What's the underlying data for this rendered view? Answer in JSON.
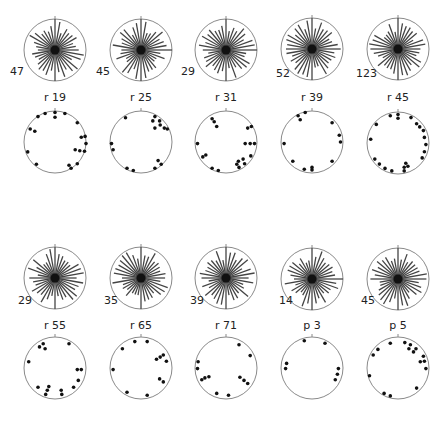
{
  "figure": {
    "colors": {
      "circle_stroke": "#8a8a8a",
      "ray": "#444444",
      "dot": "#111111",
      "text": "#222222"
    },
    "rows": [
      {
        "panels": [
          {
            "id": "r 19",
            "count": "47",
            "cx": 55,
            "rose_cy": 50,
            "dots_cy": 142,
            "r": 31,
            "east_tick": false,
            "dots": [
              [
                -0.55,
                -0.82
              ],
              [
                -0.32,
                -0.92
              ],
              [
                0.0,
                -0.95
              ],
              [
                0.0,
                -0.8
              ],
              [
                0.32,
                -0.92
              ],
              [
                0.72,
                -0.62
              ],
              [
                -0.8,
                -0.42
              ],
              [
                -0.65,
                -0.35
              ],
              [
                0.85,
                -0.15
              ],
              [
                0.97,
                -0.18
              ],
              [
                1.0,
                0.05
              ],
              [
                0.65,
                0.25
              ],
              [
                0.8,
                0.28
              ],
              [
                0.95,
                0.3
              ],
              [
                -0.88,
                0.32
              ],
              [
                -0.6,
                0.72
              ],
              [
                0.45,
                0.75
              ],
              [
                0.52,
                0.85
              ],
              [
                0.72,
                0.7
              ]
            ]
          },
          {
            "id": "r 25",
            "count": "45",
            "cx": 141,
            "rose_cy": 50,
            "dots_cy": 142,
            "r": 31,
            "east_tick": true,
            "dots": [
              [
                -0.5,
                -0.78
              ],
              [
                0.45,
                -0.82
              ],
              [
                0.38,
                -0.68
              ],
              [
                0.6,
                -0.68
              ],
              [
                0.62,
                -0.55
              ],
              [
                0.45,
                -0.45
              ],
              [
                0.75,
                -0.45
              ],
              [
                0.85,
                -0.42
              ],
              [
                -0.95,
                0.05
              ],
              [
                -0.9,
                0.25
              ],
              [
                0.55,
                0.6
              ],
              [
                0.65,
                0.72
              ],
              [
                -0.45,
                0.85
              ],
              [
                -0.25,
                0.92
              ],
              [
                0.45,
                0.85
              ]
            ]
          },
          {
            "id": "r 31",
            "count": "29",
            "cx": 226,
            "rose_cy": 50,
            "dots_cy": 142,
            "r": 31,
            "east_tick": true,
            "dots": [
              [
                -0.45,
                -0.75
              ],
              [
                -0.38,
                -0.65
              ],
              [
                -0.3,
                -0.5
              ],
              [
                0.7,
                -0.45
              ],
              [
                0.82,
                -0.5
              ],
              [
                -0.92,
                0.05
              ],
              [
                0.62,
                0.05
              ],
              [
                0.78,
                0.05
              ],
              [
                0.92,
                0.05
              ],
              [
                -0.75,
                0.48
              ],
              [
                -0.65,
                0.42
              ],
              [
                0.8,
                0.45
              ],
              [
                0.4,
                0.62
              ],
              [
                0.55,
                0.55
              ],
              [
                0.6,
                0.7
              ],
              [
                0.35,
                0.72
              ],
              [
                0.42,
                0.82
              ],
              [
                -0.45,
                0.85
              ],
              [
                -0.25,
                0.92
              ]
            ]
          },
          {
            "id": "r 39",
            "count": "52",
            "cx": 312,
            "rose_cy": 49,
            "dots_cy": 142,
            "r": 31,
            "east_tick": false,
            "dots": [
              [
                -0.45,
                -0.85
              ],
              [
                -0.38,
                -0.72
              ],
              [
                -0.22,
                -0.95
              ],
              [
                0.65,
                -0.62
              ],
              [
                0.88,
                -0.22
              ],
              [
                0.92,
                0.0
              ],
              [
                -0.9,
                0.05
              ],
              [
                -0.62,
                0.62
              ],
              [
                0.65,
                0.62
              ],
              [
                -0.25,
                0.88
              ],
              [
                0.0,
                0.82
              ],
              [
                0.0,
                0.9
              ]
            ]
          },
          {
            "id": "r 45",
            "count": "123",
            "cx": 398,
            "rose_cy": 49,
            "dots_cy": 143,
            "r": 31,
            "east_tick": false,
            "dots": [
              [
                -0.25,
                -0.88
              ],
              [
                0.0,
                -0.92
              ],
              [
                0.0,
                -0.8
              ],
              [
                0.42,
                -0.82
              ],
              [
                -0.7,
                -0.6
              ],
              [
                0.6,
                -0.62
              ],
              [
                0.7,
                -0.52
              ],
              [
                0.82,
                -0.4
              ],
              [
                -0.88,
                -0.12
              ],
              [
                0.85,
                -0.18
              ],
              [
                0.9,
                0.05
              ],
              [
                0.85,
                0.28
              ],
              [
                0.78,
                0.48
              ],
              [
                -0.75,
                0.52
              ],
              [
                -0.6,
                0.68
              ],
              [
                -0.42,
                0.82
              ],
              [
                0.25,
                0.65
              ],
              [
                0.32,
                0.75
              ],
              [
                0.2,
                0.78
              ],
              [
                0.2,
                0.9
              ],
              [
                -0.2,
                0.9
              ]
            ]
          }
        ]
      },
      {
        "panels": [
          {
            "id": "r 55",
            "count": "29",
            "cx": 55,
            "rose_cy": 278,
            "dots_cy": 368,
            "r": 31,
            "east_tick": false,
            "dots": [
              [
                -0.5,
                -0.68
              ],
              [
                -0.38,
                -0.78
              ],
              [
                -0.32,
                -0.62
              ],
              [
                0.45,
                -0.78
              ],
              [
                -0.85,
                -0.2
              ],
              [
                0.72,
                0.05
              ],
              [
                0.85,
                0.05
              ],
              [
                0.75,
                0.4
              ],
              [
                0.6,
                0.62
              ],
              [
                -0.55,
                0.62
              ],
              [
                -0.2,
                0.6
              ],
              [
                -0.25,
                0.72
              ],
              [
                -0.3,
                0.85
              ],
              [
                0.2,
                0.72
              ],
              [
                0.22,
                0.85
              ]
            ]
          },
          {
            "id": "r 65",
            "count": "35",
            "cx": 141,
            "rose_cy": 278,
            "dots_cy": 368,
            "r": 31,
            "east_tick": false,
            "dots": [
              [
                -0.2,
                -0.85
              ],
              [
                0.2,
                -0.85
              ],
              [
                -0.6,
                -0.62
              ],
              [
                0.5,
                -0.28
              ],
              [
                0.62,
                -0.35
              ],
              [
                0.72,
                -0.42
              ],
              [
                0.82,
                -0.22
              ],
              [
                -0.9,
                0.05
              ],
              [
                0.6,
                0.35
              ],
              [
                0.72,
                0.45
              ],
              [
                -0.45,
                0.78
              ],
              [
                0.2,
                0.88
              ]
            ]
          },
          {
            "id": "r 71",
            "count": "39",
            "cx": 226,
            "rose_cy": 278,
            "dots_cy": 368,
            "r": 31,
            "east_tick": false,
            "dots": [
              [
                0.42,
                -0.75
              ],
              [
                0.78,
                -0.4
              ],
              [
                -0.9,
                -0.2
              ],
              [
                -0.92,
                0.02
              ],
              [
                -0.78,
                0.38
              ],
              [
                -0.68,
                0.32
              ],
              [
                -0.55,
                0.28
              ],
              [
                0.45,
                0.3
              ],
              [
                0.58,
                0.4
              ],
              [
                0.7,
                0.5
              ],
              [
                -0.3,
                0.82
              ],
              [
                0.08,
                0.88
              ]
            ]
          },
          {
            "id": "p 3",
            "count": "14",
            "cx": 312,
            "rose_cy": 279,
            "dots_cy": 368,
            "r": 31,
            "east_tick": true,
            "dots": [
              [
                -0.25,
                -0.88
              ],
              [
                0.42,
                -0.8
              ],
              [
                -0.82,
                -0.15
              ],
              [
                -0.85,
                0.02
              ],
              [
                0.85,
                0.02
              ],
              [
                0.82,
                0.2
              ],
              [
                0.75,
                0.38
              ]
            ]
          },
          {
            "id": "p 5",
            "count": "45",
            "cx": 398,
            "rose_cy": 279,
            "dots_cy": 368,
            "r": 31,
            "east_tick": false,
            "dots": [
              [
                -0.25,
                -0.8
              ],
              [
                0.22,
                -0.82
              ],
              [
                0.4,
                -0.75
              ],
              [
                0.35,
                -0.62
              ],
              [
                0.58,
                -0.62
              ],
              [
                0.5,
                -0.52
              ],
              [
                -0.65,
                -0.6
              ],
              [
                -0.8,
                -0.42
              ],
              [
                0.82,
                -0.38
              ],
              [
                0.72,
                -0.2
              ],
              [
                0.85,
                -0.22
              ],
              [
                0.9,
                0.02
              ],
              [
                -0.92,
                0.25
              ],
              [
                0.6,
                0.65
              ],
              [
                -0.45,
                0.82
              ],
              [
                -0.25,
                0.9
              ]
            ]
          }
        ]
      }
    ],
    "labels": {
      "r19_count": "47",
      "r19_name": "r 19",
      "r25_count": "45",
      "r25_name": "r 25",
      "r31_count": "29",
      "r31_name": "r 31",
      "r39_count": "52",
      "r39_name": "r 39",
      "r45_count": "123",
      "r45_name": "r 45",
      "r55_count": "29",
      "r55_name": "r 55",
      "r65_count": "35",
      "r65_name": "r 65",
      "r71_count": "39",
      "r71_name": "r 71",
      "p3_count": "14",
      "p3_name": "p 3",
      "p5_count": "45",
      "p5_name": "p 5"
    }
  }
}
